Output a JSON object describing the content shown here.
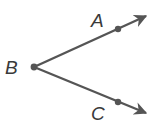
{
  "diagram": {
    "type": "geometry-angle",
    "colors": {
      "stroke": "#555555",
      "label": "#3a3a3a",
      "background": "#ffffff"
    },
    "vertex": {
      "label": "B",
      "x": 34,
      "y": 67
    },
    "rays": [
      {
        "name": "ray-BA",
        "point": {
          "label": "A",
          "x": 118,
          "y": 29
        },
        "tip": {
          "x": 148,
          "y": 15
        }
      },
      {
        "name": "ray-BC",
        "point": {
          "label": "C",
          "x": 118,
          "y": 102
        },
        "tip": {
          "x": 148,
          "y": 114
        }
      }
    ],
    "labels": {
      "a": "A",
      "b": "B",
      "c": "C"
    }
  }
}
